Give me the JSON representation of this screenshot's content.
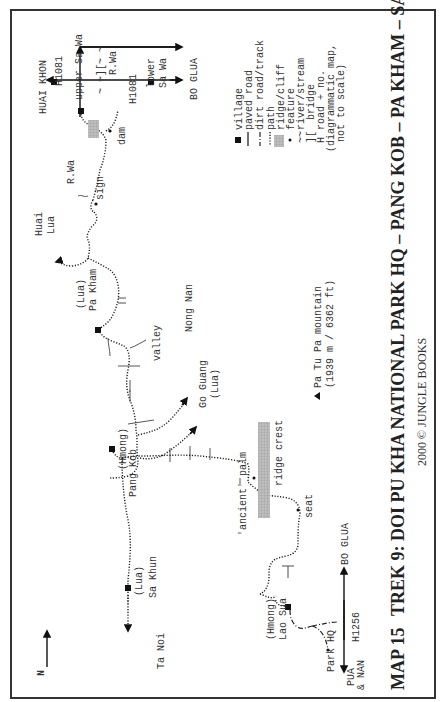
{
  "map": {
    "number_label": "MAP 15",
    "title": "TREK 9:  DOI PU KHA NATIONAL PARK HQ – PANG KOB – PA KHAM – SA WA",
    "copyright": "2000  ©  JUNGLE BOOKS",
    "north_label": "N"
  },
  "legend": [
    {
      "symbol": "village-square",
      "label": "village"
    },
    {
      "symbol": "solid-line",
      "label": "paved road"
    },
    {
      "symbol": "dash-line",
      "label": "dirt road/track"
    },
    {
      "symbol": "dotted-line",
      "label": "path"
    },
    {
      "symbol": "hatched-box",
      "label": "ridge/cliff"
    },
    {
      "symbol": "dot",
      "label": "feature"
    },
    {
      "symbol": "tilde",
      "label": "river/stream"
    },
    {
      "symbol": "bracket",
      "label": "bridge"
    },
    {
      "symbol": "H",
      "label": "road + no."
    },
    {
      "symbol": "",
      "label": "(diagrammatic map,"
    },
    {
      "symbol": "",
      "label": "not to scale)"
    }
  ],
  "legend_symbols": {
    "bracket": "][",
    "H": "H",
    "tilde": "~~"
  },
  "mountain": {
    "line1": "Pa Tu Pa mountain",
    "line2": "(1939 m / 6362 ft)"
  },
  "places": {
    "huai_khon": "HUAI KHON",
    "bo_glua_top": "BO GLUA",
    "h1081_a": "H1081",
    "h1081_b": "H1081",
    "upper_sa_wa": "upper Sa Wa",
    "lower_sa_wa_1": "lower",
    "lower_sa_wa_2": "Sa Wa",
    "r_wa_1": "R.Wa",
    "r_wa_2": "R.Wa",
    "bridge_top": "~ ~][~ ~",
    "dam": "dam",
    "sign": "sign",
    "huai_lua_1": "Huai",
    "huai_lua_2": "Lua",
    "pa_kham_1": "(Lua)",
    "pa_kham_2": "Pa Kham",
    "nong_nan": "Nong Nan",
    "valley": "valley",
    "go_guang_1": "Go Guang",
    "go_guang_2": "(Lua)",
    "pang_kob_1": "(Hmong)",
    "pang_kob_2": "Pang Kob",
    "ridge_crest": "ridge crest",
    "ancient_palm": "'ancient' palm",
    "seat": "seat",
    "sa_khun_1": "(Lua)",
    "sa_khun_2": "Sa Khun",
    "ta_noi": "Ta Noi",
    "lao_sua_1": "(Hmong)",
    "lao_sua_2": "Lao Sua",
    "park_hq": "Park HQ",
    "h1256": "H1256",
    "bo_glua_bottom": "BO GLUA",
    "pua_nan_1": "PUA",
    "pua_nan_2": "& NAN"
  }
}
